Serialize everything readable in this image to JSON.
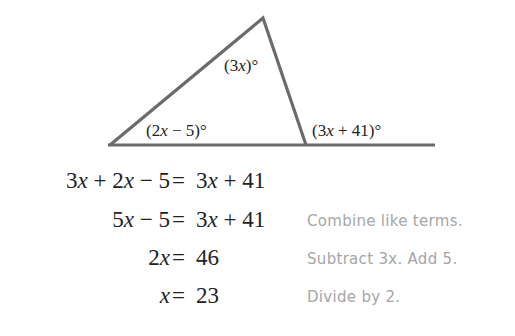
{
  "diagram": {
    "type": "triangle-exterior-angle",
    "line_color": "#6b6b6b",
    "angle_labels": {
      "apex": "(3x)°",
      "base_left": "(2x − 5)°",
      "exterior": "(3x + 41)°"
    }
  },
  "steps": [
    {
      "lhs": "3x + 2x − 5",
      "rhs": "3x + 41",
      "note": ""
    },
    {
      "lhs": "5x − 5",
      "rhs": "3x + 41",
      "note": "Combine like terms."
    },
    {
      "lhs": "2x",
      "rhs": "46",
      "note": "Subtract 3x. Add 5."
    },
    {
      "lhs": "x",
      "rhs": "23",
      "note": "Divide by 2."
    }
  ],
  "equals": "="
}
